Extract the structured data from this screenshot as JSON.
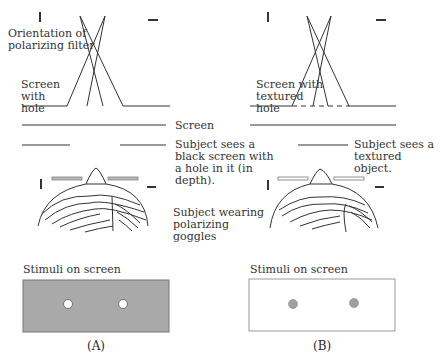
{
  "panels": [
    {
      "id": "A",
      "label": "(A)",
      "screen_label": "Screen with hole",
      "percept_label": "Subject sees a black screen with a hole in it (in depth).",
      "stimuli_label": "Stimuli on screen",
      "stimulus_background": "#a9a9a9",
      "dot_color": "#ffffff"
    },
    {
      "id": "B",
      "label": "(B)",
      "screen_label": "Screen with textured hole",
      "percept_label": "Subject sees a textured object.",
      "stimuli_label": "Stimuli on screen",
      "stimulus_background": "#ffffff",
      "dot_color": "#a0a0a0"
    }
  ],
  "shared_labels": {
    "filter_orientation": "Orientation of polarizing filter",
    "screen": "Screen",
    "subject": "Subject wearing polarizing goggles"
  },
  "icons": {
    "vertical_polarization": "vertical-bar",
    "horizontal_polarization": "horizontal-bar"
  }
}
